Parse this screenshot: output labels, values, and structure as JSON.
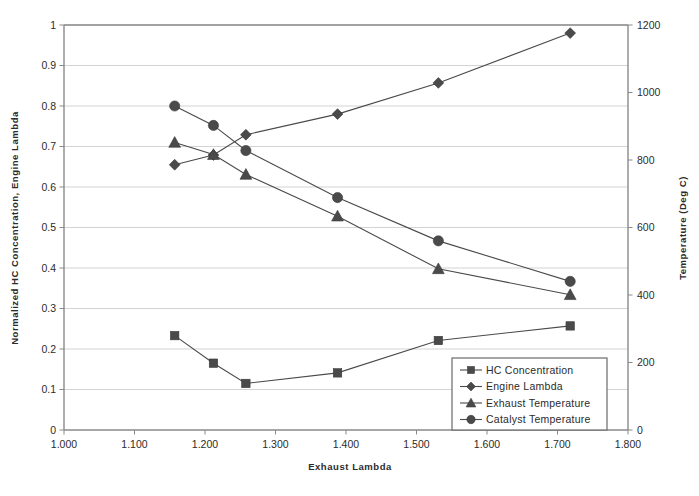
{
  "chart_data": {
    "type": "line",
    "title": "",
    "subtitle": "",
    "xlabel": "Exhaust Lambda",
    "ylabel": "Normalized HC Concentration, Engine Lambda",
    "y2label": "Temperature (Deg C)",
    "xlim": [
      1.0,
      1.8
    ],
    "ylim": [
      0,
      1
    ],
    "y2lim": [
      0,
      1200
    ],
    "grid": true,
    "legend_position": "lower-right-inside",
    "xticks": [
      "1.000",
      "1.100",
      "1.200",
      "1.300",
      "1.400",
      "1.500",
      "1.600",
      "1.700",
      "1.800"
    ],
    "xtick_values": [
      1.0,
      1.1,
      1.2,
      1.3,
      1.4,
      1.5,
      1.6,
      1.7,
      1.8
    ],
    "yticks": [
      "0",
      "0.1",
      "0.2",
      "0.3",
      "0.4",
      "0.5",
      "0.6",
      "0.7",
      "0.8",
      "0.9",
      "1"
    ],
    "ytick_values": [
      0,
      0.1,
      0.2,
      0.3,
      0.4,
      0.5,
      0.6,
      0.7,
      0.8,
      0.9,
      1.0
    ],
    "y2ticks": [
      "0",
      "200",
      "400",
      "600",
      "800",
      "1000",
      "1200"
    ],
    "y2tick_values": [
      0,
      200,
      400,
      600,
      800,
      1000,
      1200
    ],
    "x": [
      1.157,
      1.212,
      1.258,
      1.388,
      1.531,
      1.718
    ],
    "series": [
      {
        "name": "HC Concentration",
        "marker": "square",
        "axis": "left",
        "color": "#4a4a4a",
        "values": [
          0.233,
          0.165,
          0.115,
          0.141,
          0.221,
          0.257
        ]
      },
      {
        "name": "Engine Lambda",
        "marker": "diamond",
        "axis": "left",
        "color": "#4a4a4a",
        "values": [
          0.655,
          0.679,
          0.729,
          0.78,
          0.857,
          0.98
        ]
      },
      {
        "name": "Exhaust Temperature",
        "marker": "triangle",
        "axis": "right",
        "color": "#3a3a3a",
        "values": [
          0.71,
          0.68,
          0.631,
          0.528,
          0.398,
          0.334
        ],
        "values_right_axis": [
          852,
          816,
          757,
          634,
          478,
          401
        ]
      },
      {
        "name": "Catalyst Temperature",
        "marker": "circle",
        "axis": "right",
        "color": "#3a3a3a",
        "values": [
          0.8,
          0.752,
          0.69,
          0.574,
          0.467,
          0.367
        ],
        "values_right_axis": [
          960,
          902,
          828,
          689,
          560,
          440
        ]
      }
    ]
  },
  "legend": {
    "entries": [
      {
        "label": "HC Concentration",
        "marker": "square"
      },
      {
        "label": "Engine Lambda",
        "marker": "diamond"
      },
      {
        "label": "Exhaust Temperature",
        "marker": "triangle"
      },
      {
        "label": "Catalyst Temperature",
        "marker": "circle"
      }
    ]
  },
  "colors": {
    "marker": "#4a4a4a",
    "line": "#4a4a4a",
    "grid": "#c8c8c8",
    "axis": "#8a8a8a",
    "text": "#2b2b2b",
    "background": "#ffffff"
  }
}
